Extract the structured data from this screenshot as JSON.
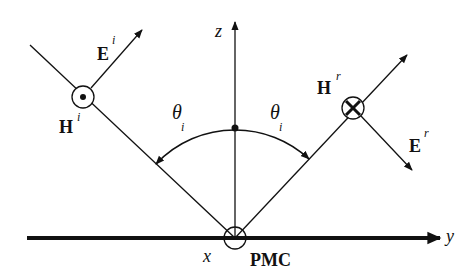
{
  "diagram": {
    "colors": {
      "stroke": "#111111",
      "background": "#ffffff"
    },
    "axes": {
      "z_label": "z",
      "y_label": "y",
      "x_label": "x"
    },
    "surface": {
      "label": "PMC"
    },
    "incident": {
      "e_label": "E",
      "e_sup": "i",
      "h_label": "H",
      "h_sup": "i",
      "h_symbol": "dot-out-of-page"
    },
    "reflected": {
      "e_label": "E",
      "e_sup": "r",
      "h_label": "H",
      "h_sup": "r",
      "h_symbol": "cross-into-page"
    },
    "angles": {
      "incident_label": "θ",
      "incident_sub": "i",
      "reflected_label": "θ",
      "reflected_sub": "i"
    }
  }
}
